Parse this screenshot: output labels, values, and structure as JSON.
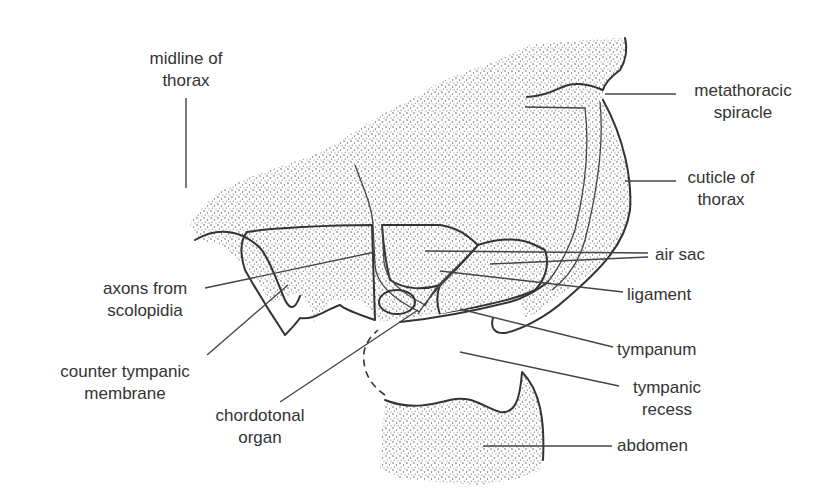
{
  "figure": {
    "type": "labeled anatomical diagram",
    "stipple_color": "#555555",
    "line_color": "#333333",
    "text_color": "#333333",
    "background": "#ffffff"
  },
  "labels": {
    "midline": {
      "line1": "midline of",
      "line2": "thorax"
    },
    "spiracle": {
      "line1": "metathoracic",
      "line2": "spiracle"
    },
    "cuticle": {
      "line1": "cuticle of",
      "line2": "thorax"
    },
    "air_sac": {
      "line1": "air sac"
    },
    "axons": {
      "line1": "axons from",
      "line2": "scolopidia"
    },
    "ligament": {
      "line1": "ligament"
    },
    "counter_tympanic": {
      "line1": "counter tympanic",
      "line2": "membrane"
    },
    "tympanum": {
      "line1": "tympanum"
    },
    "chordotonal": {
      "line1": "chordotonal",
      "line2": "organ"
    },
    "tympanic_recess": {
      "line1": "tympanic",
      "line2": "recess"
    },
    "abdomen": {
      "line1": "abdomen"
    }
  }
}
